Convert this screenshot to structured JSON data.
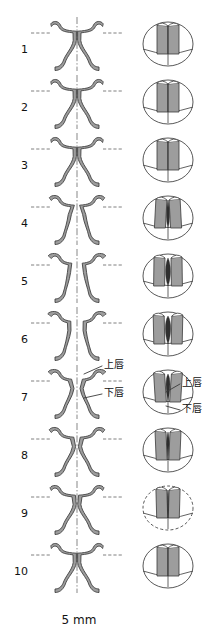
{
  "figure": {
    "name": "vocal-fold-vibration-cycle",
    "width": 219,
    "height": 640,
    "background": "#ffffff",
    "columns": {
      "left_view": "coronal-section",
      "right_view": "superior-view"
    }
  },
  "colors": {
    "tissue_fill": "#9d9d9d",
    "tissue_fill_light": "#b4b4b4",
    "outline": "#3a3a3a",
    "outline_soft": "#6f6f6f",
    "glottis_dark": "#1e1e1e",
    "midline": "#555555",
    "dash": "#555555",
    "text": "#111111",
    "page": "#ffffff"
  },
  "rows": [
    {
      "number": "1",
      "top": 16,
      "glottis": "closed",
      "right_shape": "closed"
    },
    {
      "number": "2",
      "top": 74,
      "glottis": "closed",
      "right_shape": "closed"
    },
    {
      "number": "3",
      "top": 132,
      "glottis": "closed",
      "right_shape": "closed"
    },
    {
      "number": "4",
      "top": 190,
      "glottis": "opening",
      "right_shape": "slit-narrow"
    },
    {
      "number": "5",
      "top": 248,
      "glottis": "open",
      "right_shape": "slit-wide"
    },
    {
      "number": "6",
      "top": 306,
      "glottis": "open-max",
      "right_shape": "slit-lens"
    },
    {
      "number": "7",
      "top": 364,
      "glottis": "closing-upper",
      "right_shape": "slit-lens"
    },
    {
      "number": "8",
      "top": 422,
      "glottis": "closing",
      "right_shape": "slit-thin"
    },
    {
      "number": "9",
      "top": 480,
      "glottis": "closing-lower",
      "right_shape": "slit-hairline"
    },
    {
      "number": "10",
      "top": 538,
      "glottis": "closed",
      "right_shape": "closed"
    }
  ],
  "annotations": {
    "upper_lip": "上唇",
    "lower_lip": "下唇",
    "left_upper_lip": {
      "text": "上唇",
      "x": 104,
      "y": 360
    },
    "left_lower_lip": {
      "text": "下唇",
      "x": 104,
      "y": 388
    },
    "right_upper_lip": {
      "text": "上唇",
      "x": 182,
      "y": 378
    },
    "right_lower_lip": {
      "text": "下唇",
      "x": 182,
      "y": 404
    }
  },
  "scale": {
    "label": "5 mm",
    "x": 41,
    "y": 614,
    "width": 76
  }
}
